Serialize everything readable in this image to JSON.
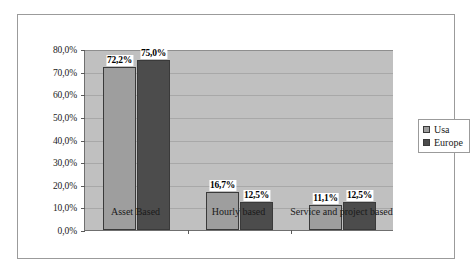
{
  "chart_data": {
    "type": "bar",
    "title": "",
    "xlabel": "",
    "ylabel": "",
    "categories": [
      "Asset Based",
      "Hourly based",
      "Service and project based"
    ],
    "series": [
      {
        "name": "Usa",
        "color": "#9e9e9e",
        "values": [
          72.2,
          16.7,
          11.1
        ],
        "labels": [
          "72,2%",
          "16,7%",
          "11,1%"
        ]
      },
      {
        "name": "Europe",
        "color": "#4c4c4c",
        "values": [
          75.0,
          12.5,
          12.5
        ],
        "labels": [
          "75,0%",
          "12,5%",
          "12,5%"
        ]
      }
    ],
    "ylim": [
      0,
      80
    ],
    "ytick_values": [
      0,
      10,
      20,
      30,
      40,
      50,
      60,
      70,
      80
    ],
    "ytick_labels": [
      "0,0%",
      "10,0%",
      "20,0%",
      "30,0%",
      "40,0%",
      "50,0%",
      "60,0%",
      "70,0%",
      "80,0%"
    ],
    "grid": true,
    "legend_position": "right",
    "legend_entries": [
      "Usa",
      "Europe"
    ],
    "plot_background": "#c0c0c0",
    "frame_background": "#ffffff"
  }
}
